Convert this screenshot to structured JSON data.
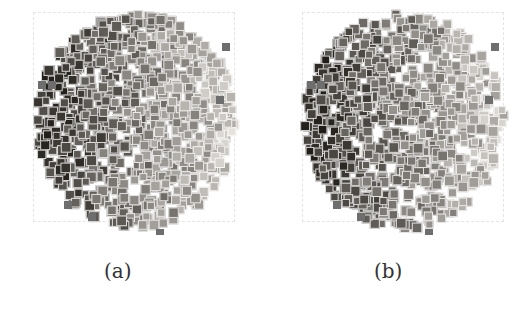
{
  "figure": {
    "panels": [
      {
        "id": "a",
        "caption": "(a)",
        "seed": 7
      },
      {
        "id": "b",
        "caption": "(b)",
        "seed": 11
      }
    ],
    "colors": {
      "frame": "#e4e4e4",
      "dark_thumb": "#2a2a2a",
      "light_thumb": "#d0d0d0"
    }
  }
}
